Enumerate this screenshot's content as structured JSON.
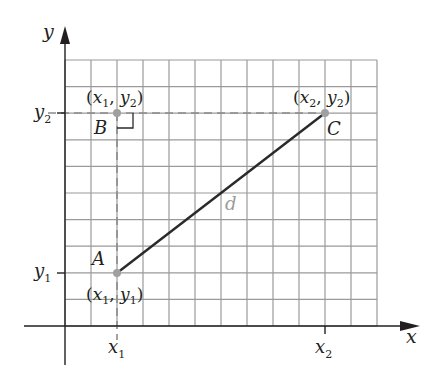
{
  "diagram": {
    "axes": {
      "x_label": "x",
      "y_label": "y"
    },
    "ticks": {
      "x1": "x",
      "x1_sub": "1",
      "x2": "x",
      "x2_sub": "2",
      "y1": "y",
      "y1_sub": "1",
      "y2": "y",
      "y2_sub": "2"
    },
    "points": [
      {
        "name": "A",
        "coord_label": "(x1, y1)",
        "x_var": "x",
        "x_sub": "1",
        "y_var": "y",
        "y_sub": "1"
      },
      {
        "name": "B",
        "coord_label": "(x1, y2)",
        "x_var": "x",
        "x_sub": "1",
        "y_var": "y",
        "y_sub": "2"
      },
      {
        "name": "C",
        "coord_label": "(x2, y2)",
        "x_var": "x",
        "x_sub": "2",
        "y_var": "y",
        "y_sub": "2"
      }
    ],
    "segment_label": "d",
    "colors": {
      "grid": "#9a9a9a",
      "axis": "#231f20",
      "segment": "#2a2a2a",
      "dashed": "#8c8c8c",
      "point": "#a0a0a0",
      "d_label": "#9a9a9a"
    },
    "grid": {
      "columns": 12,
      "rows": 10
    }
  }
}
